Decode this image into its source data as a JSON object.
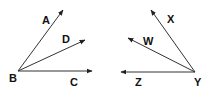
{
  "figures": [
    {
      "name": "angle-figure-left",
      "vertex": {
        "label": "B",
        "x": 18,
        "y": 71,
        "lx": 9,
        "ly": 82
      },
      "rays": [
        {
          "label": "A",
          "x2": 63,
          "y2": 10,
          "lx": 42,
          "ly": 24
        },
        {
          "label": "D",
          "x2": 85,
          "y2": 40,
          "lx": 62,
          "ly": 43
        },
        {
          "label": "C",
          "x2": 92,
          "y2": 71,
          "lx": 70,
          "ly": 86
        }
      ]
    },
    {
      "name": "angle-figure-right",
      "vertex": {
        "label": "Y",
        "x": 195,
        "y": 72,
        "lx": 194,
        "ly": 86
      },
      "rays": [
        {
          "label": "X",
          "x2": 151,
          "y2": 10,
          "lx": 167,
          "ly": 23
        },
        {
          "label": "W",
          "x2": 128,
          "y2": 38,
          "lx": 143,
          "ly": 45
        },
        {
          "label": "Z",
          "x2": 121,
          "y2": 72,
          "lx": 135,
          "ly": 86
        }
      ]
    }
  ],
  "colors": {
    "stroke": "#333333",
    "text": "#111111"
  }
}
